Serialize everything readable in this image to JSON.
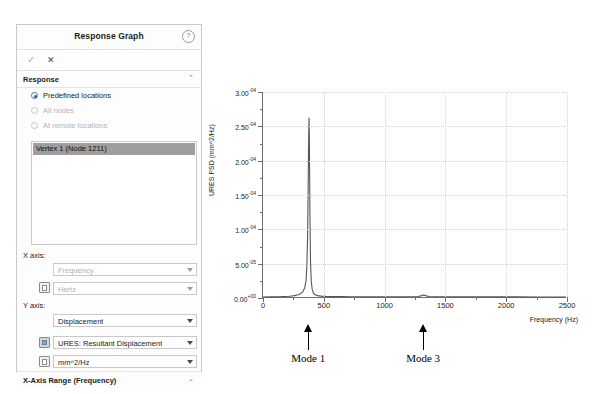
{
  "panel": {
    "title": "Response Graph",
    "help_icon": "?",
    "confirm_icon": "✓",
    "cancel_icon": "✕",
    "sections": [
      {
        "label": "Response",
        "chevron": "⌃"
      },
      {
        "label": "X-Axis Range  (Frequency)",
        "chevron": "⌄"
      }
    ],
    "radios": [
      {
        "label": "Predefined locations",
        "selected": true,
        "disabled": false
      },
      {
        "label": "All nodes",
        "selected": false,
        "disabled": true
      },
      {
        "label": "At remote locations",
        "selected": false,
        "disabled": true
      }
    ],
    "list": {
      "items": [
        {
          "label": "Vertex 1 (Node 1211)",
          "selected": true
        }
      ]
    },
    "x_axis_label": "X axis:",
    "y_axis_label": "Y axis:",
    "fields": {
      "x_quantity": "Frequency",
      "x_unit": "Hertz",
      "y_quantity": "Displacement",
      "y_component": "URES:  Resultant Displacement",
      "y_unit": "mm^2/Hz"
    }
  },
  "chart_data": {
    "type": "line",
    "title": "",
    "xlabel": "Frequency (Hz)",
    "ylabel": "URES PSD (mm^2/Hz)",
    "xlim": [
      0,
      2500
    ],
    "ylim": [
      0,
      0.0003
    ],
    "grid": true,
    "legend": false,
    "xticklabels": [
      "0",
      "500",
      "1000",
      "1500",
      "2000",
      "2500"
    ],
    "xtickvalues": [
      0,
      500,
      1000,
      1500,
      2000,
      2500
    ],
    "yticklabels": [
      "0.00e+00",
      "5.00e-05",
      "1.00e-04",
      "1.50e-04",
      "2.00e-04",
      "2.50e-04",
      "3.00e-04"
    ],
    "ytickvalues": [
      0,
      5e-05,
      0.0001,
      0.00015,
      0.0002,
      0.00025,
      0.0003
    ],
    "series": [
      {
        "name": "URES PSD",
        "x": [
          0,
          60,
          120,
          180,
          220,
          260,
          290,
          310,
          330,
          345,
          355,
          362,
          368,
          372,
          375,
          378,
          380,
          382,
          385,
          388,
          392,
          398,
          405,
          415,
          430,
          450,
          480,
          520,
          580,
          650,
          720,
          800,
          900,
          1000,
          1100,
          1200,
          1280,
          1310,
          1325,
          1340,
          1370,
          1420,
          1500,
          1650,
          1800,
          1950,
          2100,
          2250,
          2400,
          2500
        ],
        "y": [
          0.0,
          2e-07,
          4e-07,
          8e-07,
          1.2e-06,
          2e-06,
          3.2e-06,
          4.8e-06,
          8e-06,
          1.4e-05,
          2.4e-05,
          4.5e-05,
          9e-05,
          0.00015,
          0.000205,
          0.000245,
          0.000262,
          0.00024,
          0.000175,
          0.000105,
          5.2e-05,
          2.4e-05,
          1.2e-05,
          6e-06,
          3.2e-06,
          2e-06,
          1.3e-06,
          9e-07,
          6e-07,
          5e-07,
          4e-07,
          4e-07,
          3e-07,
          3e-07,
          3e-07,
          4e-07,
          8e-07,
          2e-06,
          3e-06,
          2e-06,
          8e-07,
          4e-07,
          3e-07,
          2e-07,
          2e-07,
          2e-07,
          2e-07,
          1e-07,
          1e-07,
          1e-07
        ]
      }
    ],
    "annotations": [
      {
        "label": "Mode 1",
        "x": 380
      },
      {
        "label": "Mode 3",
        "x": 1325
      }
    ]
  }
}
